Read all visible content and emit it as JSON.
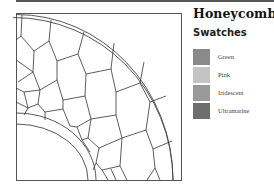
{
  "title": "Honeycomb",
  "swatches": {
    "heading": "Swatches",
    "items": [
      {
        "label": "Green",
        "color": "#8a8a8a"
      },
      {
        "label": "Pink",
        "color": "#c4c4c4"
      },
      {
        "label": "Iridescent",
        "color": "#9a9a9a"
      },
      {
        "label": "Ultramarine",
        "color": "#6e6e6e"
      }
    ]
  },
  "diagram": {
    "frame_color": "#555555",
    "line_color": "#333333"
  }
}
